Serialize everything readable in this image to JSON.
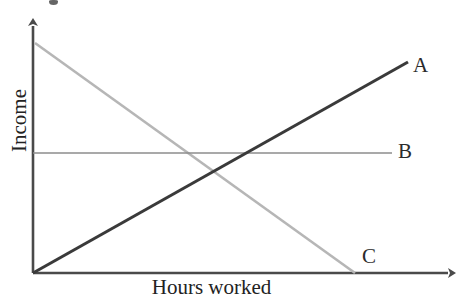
{
  "chart_data": {
    "type": "line",
    "title": "",
    "subtitle": "",
    "xlabel": "Hours worked",
    "ylabel": "Income",
    "xlim": [
      0,
      100
    ],
    "ylim": [
      0,
      100
    ],
    "grid": false,
    "legend_position": "inline-right-of-line-ends",
    "axis_style": "arrow-headed open axes, no tick marks, no tick labels",
    "annotations": [
      {
        "name": "A",
        "text": "A",
        "x": 93.0,
        "y": 86.0
      },
      {
        "name": "B",
        "text": "B",
        "x": 89.5,
        "y": 50.0
      },
      {
        "name": "C",
        "text": "C",
        "x": 78.5,
        "y": 7.5
      }
    ],
    "series": [
      {
        "name": "A",
        "label": "A",
        "color": "#3a3a3a",
        "line_width": 3.1,
        "description": "Income rises steadily as hours worked increase",
        "x": [
          0,
          100
        ],
        "y": [
          0,
          100
        ],
        "points_px": [
          [
            33,
            273
          ],
          [
            408,
            62
          ]
        ]
      },
      {
        "name": "B",
        "label": "B",
        "color": "#8d8d8d",
        "line_width": 1.6,
        "description": "Income stays constant regardless of hours worked",
        "x": [
          0,
          95
        ],
        "y": [
          50,
          50
        ],
        "points_px": [
          [
            33,
            153
          ],
          [
            392,
            153
          ]
        ]
      },
      {
        "name": "C",
        "label": "C",
        "color": "#b6b6b6",
        "line_width": 2.6,
        "description": "Income falls steadily as hours worked increase",
        "x": [
          0,
          85
        ],
        "y": [
          100,
          0
        ],
        "points_px": [
          [
            35,
            43
          ],
          [
            355,
            273
          ]
        ]
      }
    ],
    "intersections": [
      {
        "between": [
          "A",
          "C"
        ],
        "x_px": 210,
        "y_px": 182
      },
      {
        "between": [
          "A",
          "B"
        ],
        "x_px": 246,
        "y_px": 153
      },
      {
        "between": [
          "B",
          "C"
        ],
        "x_px": 188,
        "y_px": 153
      }
    ]
  },
  "axes": {
    "y_axis_label": "Income",
    "x_axis_label": "Hours worked",
    "origin_px": [
      33,
      273
    ],
    "y_axis_top_px": [
      33,
      20
    ],
    "x_axis_right_px": [
      455,
      273
    ],
    "axis_color": "#4a4a4a"
  },
  "labels": {
    "a": "A",
    "b": "B",
    "c": "C"
  },
  "colors": {
    "background": "#ffffff",
    "axis": "#4a4a4a",
    "series_a": "#3a3a3a",
    "series_b": "#8d8d8d",
    "series_c": "#b6b6b6",
    "text": "#222222"
  }
}
